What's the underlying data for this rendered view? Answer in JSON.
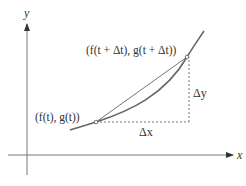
{
  "diagram": {
    "axes": {
      "x_label": "x",
      "y_label": "y"
    },
    "points": {
      "start": {
        "label": "(f(t), g(t))",
        "x": 96,
        "y": 122
      },
      "end": {
        "label": "(f(t + Δt), g(t + Δt))",
        "x": 187,
        "y": 57
      }
    },
    "increments": {
      "dx_label": "Δx",
      "dy_label": "Δy"
    },
    "colors": {
      "stroke": "#666666",
      "text": "#333333",
      "point_fill": "#ffffff"
    }
  }
}
